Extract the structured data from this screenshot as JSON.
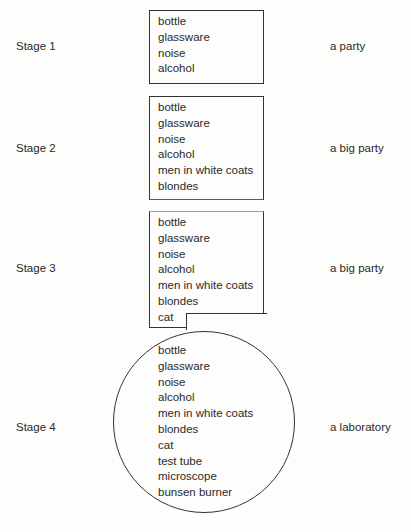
{
  "stages": [
    {
      "label": "Stage 1",
      "interpretation": "a party",
      "items": [
        "bottle",
        "glassware",
        "noise",
        "alcohol"
      ]
    },
    {
      "label": "Stage 2",
      "interpretation": "a big party",
      "items": [
        "bottle",
        "glassware",
        "noise",
        "alcohol",
        "men in white coats",
        "blondes"
      ]
    },
    {
      "label": "Stage 3",
      "interpretation": "a big party",
      "items": [
        "bottle",
        "glassware",
        "noise",
        "alcohol",
        "men in white coats",
        "blondes",
        "cat"
      ]
    },
    {
      "label": "Stage 4",
      "interpretation": "a laboratory",
      "items": [
        "bottle",
        "glassware",
        "noise",
        "alcohol",
        "men in white coats",
        "blondes",
        "cat",
        "test tube",
        "microscope",
        "bunsen burner"
      ]
    }
  ],
  "colors": {
    "border": "#333333",
    "stage2_bottom_border": "#4a4ad0",
    "stage3_top_border": "#6fbf7f"
  }
}
